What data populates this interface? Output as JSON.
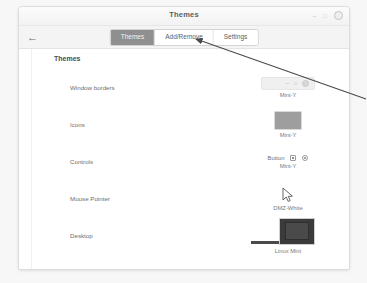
{
  "window": {
    "title": "Themes",
    "controls": {
      "minimize": "–",
      "maximize": "□",
      "close": "close-button"
    }
  },
  "toolbar": {
    "back_label": "←",
    "tabs": [
      {
        "label": "Themes",
        "active": true
      },
      {
        "label": "Add/Remove",
        "active": false
      },
      {
        "label": "Settings",
        "active": false
      }
    ]
  },
  "content": {
    "section_title": "Themes",
    "rows": [
      {
        "label": "Window borders",
        "value": "Mint-Y",
        "preview": "titlebar-widget"
      },
      {
        "label": "Icons",
        "value": "Mint-Y",
        "preview": "icon-swatch"
      },
      {
        "label": "Controls",
        "value": "Mint-Y",
        "preview": "controls-widget",
        "button_label": "Button"
      },
      {
        "label": "Mouse Pointer",
        "value": "DMZ-White",
        "preview": "cursor-glyph"
      },
      {
        "label": "Desktop",
        "value": "Linux Mint",
        "preview": "desktop-thumbnail"
      }
    ]
  },
  "annotation": {
    "target_tab": "Add/Remove",
    "color": "#4a4a4a"
  }
}
